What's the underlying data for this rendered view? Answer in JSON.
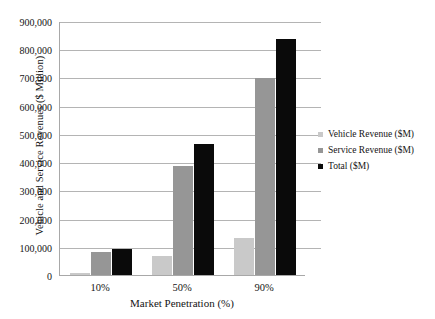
{
  "chart_data": {
    "type": "bar",
    "title": "",
    "subtitle": "",
    "xlabel": "Market Penetration (%)",
    "ylabel": "Vehicle and Service Revenues ($ Million)",
    "categories": [
      "10%",
      "50%",
      "90%"
    ],
    "series": [
      {
        "name": "Vehicle Revenue ($M)",
        "color": "#c9c9c9",
        "values": [
          8000,
          68000,
          130000
        ]
      },
      {
        "name": "Service Revenue ($M)",
        "color": "#969696",
        "values": [
          80000,
          385000,
          698000
        ]
      },
      {
        "name": "Total ($M)",
        "color": "#0a0a0a",
        "values": [
          92000,
          465000,
          835000
        ]
      }
    ],
    "ylim": [
      0,
      900000
    ],
    "ytick_values": [
      0,
      100000,
      200000,
      300000,
      400000,
      500000,
      600000,
      700000,
      800000,
      900000
    ],
    "ytick_labels": [
      "0",
      "100,000",
      "200,000",
      "300,000",
      "400,000",
      "500,000",
      "600,000",
      "700,000",
      "800,000",
      "900,000"
    ],
    "grid": true,
    "grid_axis": "y",
    "legend_position": "right",
    "background_color": "#ffffff",
    "gridline_color": "#b4b4b4",
    "axis_color": "#a8a8a8"
  },
  "axes": {
    "y_title": "Vehicle and Service Revenues ($ Million)",
    "x_title": "Market Penetration (%)"
  },
  "legend": {
    "items": [
      {
        "label": "Vehicle Revenue ($M)",
        "color": "#c9c9c9"
      },
      {
        "label": "Service Revenue ($M)",
        "color": "#969696"
      },
      {
        "label": "Total ($M)",
        "color": "#0a0a0a"
      }
    ]
  }
}
